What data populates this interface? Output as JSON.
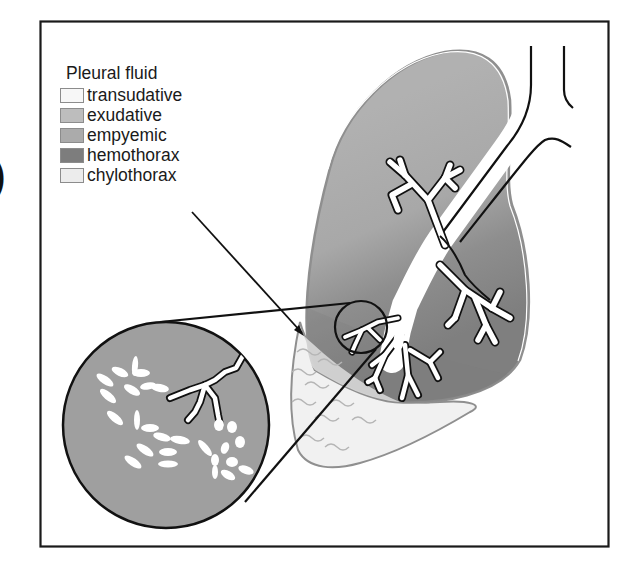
{
  "figure": {
    "edge_glyph": ")",
    "legend": {
      "title": "Pleural fluid",
      "items": [
        {
          "label": "transudative",
          "color": "#f7f7f7"
        },
        {
          "label": "exudative",
          "color": "#bdbdbd"
        },
        {
          "label": "empyemic",
          "color": "#ababab"
        },
        {
          "label": "hemothorax",
          "color": "#7d7d7d"
        },
        {
          "label": "chylothorax",
          "color": "#ececec"
        }
      ]
    },
    "colors": {
      "frame": "#1a1a1a",
      "lung_fill": "#a9a9a9",
      "lung_dark": "#858585",
      "fluid_fill": "#f1f1f1",
      "fluid_wave": "#b5b5b5",
      "magnified_fill": "#9f9f9f",
      "outline_gray": "#8f8f8f"
    }
  }
}
